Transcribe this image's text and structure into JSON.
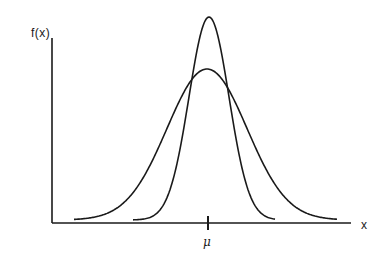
{
  "chart_data": {
    "type": "line",
    "title": "",
    "xlabel": "x",
    "ylabel": "f(x)",
    "x_ticks": [
      {
        "position": "mu",
        "label": "μ"
      }
    ],
    "grid": false,
    "legend": null,
    "series": [
      {
        "name": "narrow (small variance) normal curve",
        "mean_px": 209,
        "peak_y_px": 17,
        "sigma_px": 20,
        "x_range_px": [
          133,
          275
        ]
      },
      {
        "name": "wide (large variance) normal curve",
        "mean_px": 207,
        "peak_y_px": 69,
        "sigma_px": 40,
        "x_range_px": [
          74,
          337
        ]
      }
    ],
    "axis": {
      "origin_px": [
        52,
        223
      ],
      "x_end_px": 351,
      "y_top_px": 38,
      "baseline_y_px": 223
    }
  },
  "labels": {
    "y_axis": "f(x)",
    "x_axis": "x",
    "tick_mu": "μ"
  },
  "colors": {
    "ink": "#1a1a1a",
    "background": "#ffffff"
  }
}
